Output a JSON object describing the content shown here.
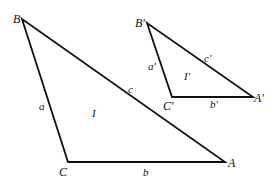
{
  "diagram": {
    "type": "similar-triangles",
    "triangle_large": {
      "name": "I",
      "vertices": {
        "B": {
          "label": "B",
          "x": 22,
          "y": 19
        },
        "C": {
          "label": "C",
          "x": 68,
          "y": 162
        },
        "A": {
          "label": "A",
          "x": 225,
          "y": 162
        }
      },
      "sides": {
        "a": {
          "label": "a",
          "from": "B",
          "to": "C"
        },
        "b": {
          "label": "b",
          "from": "C",
          "to": "A"
        },
        "c": {
          "label": "c",
          "from": "B",
          "to": "A"
        }
      }
    },
    "triangle_small": {
      "name": "I′",
      "vertices": {
        "B": {
          "label": "B′",
          "x": 147,
          "y": 23
        },
        "C": {
          "label": "C′",
          "x": 172,
          "y": 97
        },
        "A": {
          "label": "A′",
          "x": 253,
          "y": 97
        }
      },
      "sides": {
        "a": {
          "label": "a′",
          "from": "B′",
          "to": "C′"
        },
        "b": {
          "label": "b′",
          "from": "C′",
          "to": "A′"
        },
        "c": {
          "label": "c′",
          "from": "B′",
          "to": "A′"
        }
      }
    }
  }
}
